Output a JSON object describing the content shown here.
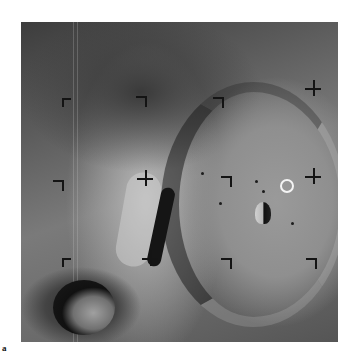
{
  "figure": {
    "panel_label": "a",
    "photo_bounds": {
      "x": 21,
      "y": 22,
      "width": 317,
      "height": 320
    },
    "highlight_ring": {
      "x": 286,
      "y": 185,
      "radius": 6,
      "color": "#f4f4f4"
    },
    "fiducial_color": "#141414",
    "fiducials": [
      {
        "x": 62,
        "y": 98,
        "type": "corner"
      },
      {
        "x": 145,
        "y": 96,
        "type": "tee"
      },
      {
        "x": 222,
        "y": 97,
        "type": "tee"
      },
      {
        "x": 313,
        "y": 88,
        "type": "cross"
      },
      {
        "x": 62,
        "y": 180,
        "type": "tee"
      },
      {
        "x": 145,
        "y": 178,
        "type": "cross"
      },
      {
        "x": 230,
        "y": 176,
        "type": "tee"
      },
      {
        "x": 313,
        "y": 176,
        "type": "cross"
      },
      {
        "x": 62,
        "y": 258,
        "type": "corner"
      },
      {
        "x": 150,
        "y": 258,
        "type": "cross"
      },
      {
        "x": 230,
        "y": 258,
        "type": "tee"
      },
      {
        "x": 315,
        "y": 258,
        "type": "tee"
      }
    ]
  }
}
